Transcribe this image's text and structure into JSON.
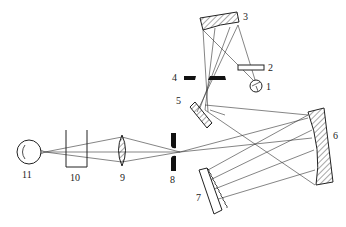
{
  "diagram": {
    "type": "optical schematic (spectrophotometer)",
    "labels": [
      "1",
      "2",
      "3",
      "4",
      "5",
      "6",
      "7",
      "8",
      "9",
      "10",
      "11"
    ],
    "components": [
      {
        "id": "1",
        "shape": "lamp circle"
      },
      {
        "id": "2",
        "shape": "filter plate"
      },
      {
        "id": "3",
        "shape": "concave mirror"
      },
      {
        "id": "4",
        "shape": "entrance slit"
      },
      {
        "id": "5",
        "shape": "plane mirror"
      },
      {
        "id": "6",
        "shape": "collimating concave mirror"
      },
      {
        "id": "7",
        "shape": "diffraction grating"
      },
      {
        "id": "8",
        "shape": "exit slit"
      },
      {
        "id": "9",
        "shape": "lens"
      },
      {
        "id": "10",
        "shape": "sample cell"
      },
      {
        "id": "11",
        "shape": "detector"
      }
    ]
  }
}
